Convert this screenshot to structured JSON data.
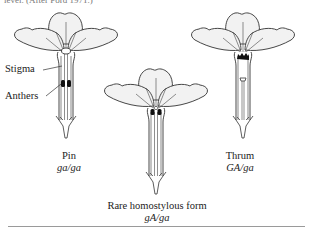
{
  "figure": {
    "caption_fragment": "level. (After Ford 1971.)",
    "callouts": {
      "stigma": "Stigma",
      "anthers": "Anthers"
    },
    "flowers": [
      {
        "name": "Pin",
        "genotype": "ga/ga"
      },
      {
        "name": "Rare homostylous form",
        "genotype": "gA/ga"
      },
      {
        "name": "Thrum",
        "genotype": "GA/ga"
      }
    ],
    "colors": {
      "petal_fill": "#f2f2f2",
      "outline": "#333333",
      "anther": "#111111",
      "rule": "#9a9a9a"
    }
  }
}
